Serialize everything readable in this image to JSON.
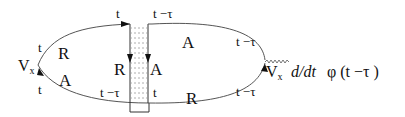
{
  "diagram": {
    "type": "keldysh-contour-diagram",
    "left_vertex": {
      "label": "V",
      "subscript": "x"
    },
    "right_vertex": {
      "label": "V",
      "subscript": "x",
      "expression": "d/dt",
      "field": "φ (t −τ  )"
    },
    "left_loop": {
      "upper": {
        "propagator": "R",
        "time_start": "t",
        "time_end": "t"
      },
      "lower": {
        "propagator": "A",
        "time_start": "t",
        "time_end": "t −τ"
      }
    },
    "ladder": {
      "left_rail": {
        "propagator": "R",
        "time_top": "t",
        "time_bottom": "t −τ"
      },
      "right_rail": {
        "propagator": "A",
        "time_top": "t −τ",
        "time_bottom": "t"
      }
    },
    "right_loop": {
      "upper": {
        "propagator": "A",
        "time_end": "t −τ"
      },
      "lower": {
        "propagator": "R",
        "time_end": "t −τ"
      }
    }
  }
}
